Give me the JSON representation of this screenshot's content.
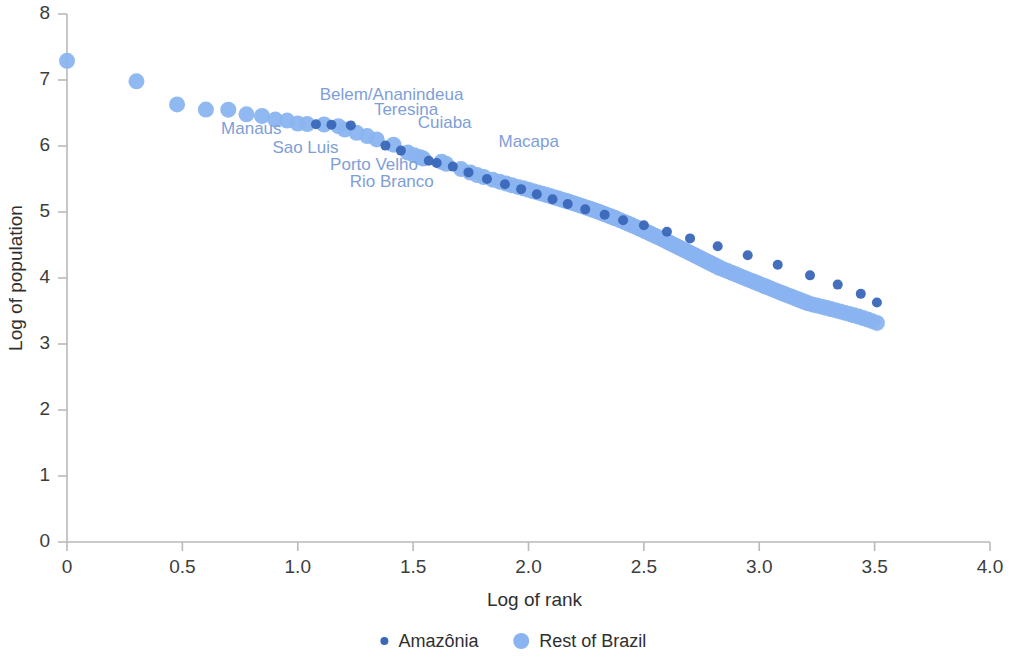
{
  "chart_data": {
    "type": "scatter",
    "title": "",
    "xlabel": "Log of rank",
    "ylabel": "Log of population",
    "xlim": [
      0,
      4.0
    ],
    "ylim": [
      0,
      8
    ],
    "xticks": [
      "0",
      "0.5",
      "1.0",
      "1.5",
      "2.0",
      "2.5",
      "3.0",
      "3.5",
      "4.0"
    ],
    "xtick_values": [
      0,
      0.5,
      1.0,
      1.5,
      2.0,
      2.5,
      3.0,
      3.5,
      4.0
    ],
    "yticks": [
      "0",
      "1",
      "2",
      "3",
      "4",
      "5",
      "6",
      "7",
      "8"
    ],
    "ytick_values": [
      0,
      1,
      2,
      3,
      4,
      5,
      6,
      7,
      8
    ],
    "grid": false,
    "legend_position": "bottom-center",
    "colors": {
      "amazonia": "#3a67b8",
      "rest_of_brazil": "#8ab4f0",
      "annotation": "#7e9ed8",
      "axis": "#b9b9b9",
      "text": "#3d3d3d"
    },
    "series": [
      {
        "name": "Amazônia",
        "color": "#3a67b8",
        "marker_size": 5,
        "points": [
          [
            1.079,
            6.33
          ],
          [
            1.146,
            6.323
          ],
          [
            1.23,
            6.312
          ],
          [
            1.38,
            6.006
          ],
          [
            1.447,
            5.93
          ],
          [
            1.568,
            5.777
          ],
          [
            1.602,
            5.742
          ],
          [
            1.672,
            5.688
          ],
          [
            1.74,
            5.6
          ],
          [
            1.82,
            5.5
          ],
          [
            1.898,
            5.42
          ],
          [
            1.968,
            5.346
          ],
          [
            2.036,
            5.268
          ],
          [
            2.104,
            5.194
          ],
          [
            2.17,
            5.12
          ],
          [
            2.246,
            5.04
          ],
          [
            2.33,
            4.958
          ],
          [
            2.41,
            4.876
          ],
          [
            2.5,
            4.8
          ],
          [
            2.6,
            4.7
          ],
          [
            2.7,
            4.6
          ],
          [
            2.82,
            4.48
          ],
          [
            2.95,
            4.345
          ],
          [
            3.08,
            4.2
          ],
          [
            3.22,
            4.04
          ],
          [
            3.34,
            3.9
          ],
          [
            3.44,
            3.76
          ],
          [
            3.51,
            3.63
          ]
        ]
      },
      {
        "name": "Rest of Brazil",
        "color": "#8ab4f0",
        "marker_size": 8,
        "points": [
          [
            0.0,
            7.29
          ],
          [
            0.301,
            6.98
          ],
          [
            0.477,
            6.63
          ],
          [
            0.602,
            6.552
          ],
          [
            0.699,
            6.55
          ],
          [
            0.778,
            6.48
          ],
          [
            0.845,
            6.455
          ],
          [
            0.903,
            6.4
          ],
          [
            0.954,
            6.385
          ],
          [
            1.0,
            6.34
          ],
          [
            1.041,
            6.332
          ],
          [
            1.114,
            6.326
          ],
          [
            1.176,
            6.3
          ],
          [
            1.204,
            6.25
          ],
          [
            1.255,
            6.2
          ],
          [
            1.301,
            6.15
          ],
          [
            1.342,
            6.1
          ],
          [
            1.415,
            6.02
          ],
          [
            1.477,
            5.9
          ],
          [
            1.505,
            5.86
          ],
          [
            1.531,
            5.83
          ],
          [
            1.544,
            5.81
          ],
          [
            1.623,
            5.76
          ],
          [
            1.643,
            5.73
          ],
          [
            1.708,
            5.65
          ],
          [
            1.748,
            5.598
          ],
          [
            1.778,
            5.56
          ],
          [
            1.806,
            5.53
          ],
          [
            1.845,
            5.49
          ],
          [
            1.875,
            5.46
          ],
          [
            1.903,
            5.43
          ],
          [
            1.929,
            5.404
          ],
          [
            1.954,
            5.38
          ],
          [
            1.978,
            5.358
          ],
          [
            2.0,
            5.336
          ],
          [
            2.021,
            5.314
          ],
          [
            2.041,
            5.294
          ],
          [
            2.061,
            5.275
          ],
          [
            2.079,
            5.256
          ],
          [
            2.097,
            5.238
          ],
          [
            2.114,
            5.22
          ],
          [
            2.13,
            5.203
          ],
          [
            2.146,
            5.186
          ],
          [
            2.161,
            5.17
          ],
          [
            2.176,
            5.154
          ],
          [
            2.19,
            5.138
          ],
          [
            2.204,
            5.122
          ],
          [
            2.217,
            5.107
          ],
          [
            2.23,
            5.092
          ],
          [
            2.243,
            5.077
          ],
          [
            2.255,
            5.062
          ],
          [
            2.267,
            5.048
          ],
          [
            2.279,
            5.034
          ],
          [
            2.29,
            5.02
          ],
          [
            2.301,
            5.006
          ],
          [
            2.312,
            4.992
          ],
          [
            2.322,
            4.978
          ],
          [
            2.332,
            4.965
          ],
          [
            2.342,
            4.952
          ],
          [
            2.352,
            4.939
          ],
          [
            2.362,
            4.926
          ],
          [
            2.371,
            4.913
          ],
          [
            2.38,
            4.9
          ],
          [
            2.398,
            4.875
          ],
          [
            2.415,
            4.85
          ],
          [
            2.431,
            4.826
          ],
          [
            2.447,
            4.802
          ],
          [
            2.462,
            4.778
          ],
          [
            2.477,
            4.755
          ],
          [
            2.491,
            4.732
          ],
          [
            2.505,
            4.71
          ],
          [
            2.519,
            4.688
          ],
          [
            2.532,
            4.666
          ],
          [
            2.545,
            4.645
          ],
          [
            2.558,
            4.624
          ],
          [
            2.571,
            4.603
          ],
          [
            2.583,
            4.582
          ],
          [
            2.595,
            4.562
          ],
          [
            2.607,
            4.542
          ],
          [
            2.618,
            4.522
          ],
          [
            2.629,
            4.503
          ],
          [
            2.64,
            4.484
          ],
          [
            2.651,
            4.465
          ],
          [
            2.662,
            4.446
          ],
          [
            2.672,
            4.428
          ],
          [
            2.683,
            4.41
          ],
          [
            2.693,
            4.392
          ],
          [
            2.703,
            4.374
          ],
          [
            2.713,
            4.357
          ],
          [
            2.723,
            4.34
          ],
          [
            2.732,
            4.323
          ],
          [
            2.742,
            4.306
          ],
          [
            2.751,
            4.29
          ],
          [
            2.76,
            4.274
          ],
          [
            2.77,
            4.258
          ],
          [
            2.778,
            4.242
          ],
          [
            2.787,
            4.226
          ],
          [
            2.796,
            4.211
          ],
          [
            2.805,
            4.196
          ],
          [
            2.813,
            4.181
          ],
          [
            2.822,
            4.166
          ],
          [
            2.83,
            4.152
          ],
          [
            2.845,
            4.13
          ],
          [
            2.863,
            4.105
          ],
          [
            2.881,
            4.08
          ],
          [
            2.898,
            4.056
          ],
          [
            2.914,
            4.032
          ],
          [
            2.93,
            4.009
          ],
          [
            2.946,
            3.986
          ],
          [
            2.962,
            3.964
          ],
          [
            2.978,
            3.942
          ],
          [
            2.993,
            3.92
          ],
          [
            3.008,
            3.899
          ],
          [
            3.023,
            3.878
          ],
          [
            3.037,
            3.858
          ],
          [
            3.051,
            3.838
          ],
          [
            3.064,
            3.819
          ],
          [
            3.078,
            3.8
          ],
          [
            3.091,
            3.782
          ],
          [
            3.104,
            3.764
          ],
          [
            3.117,
            3.746
          ],
          [
            3.13,
            3.728
          ],
          [
            3.143,
            3.711
          ],
          [
            3.155,
            3.694
          ],
          [
            3.167,
            3.678
          ],
          [
            3.179,
            3.662
          ],
          [
            3.19,
            3.646
          ],
          [
            3.201,
            3.631
          ],
          [
            3.212,
            3.616
          ],
          [
            3.23,
            3.6
          ],
          [
            3.25,
            3.582
          ],
          [
            3.27,
            3.565
          ],
          [
            3.29,
            3.548
          ],
          [
            3.31,
            3.53
          ],
          [
            3.33,
            3.512
          ],
          [
            3.35,
            3.494
          ],
          [
            3.37,
            3.475
          ],
          [
            3.39,
            3.456
          ],
          [
            3.41,
            3.436
          ],
          [
            3.43,
            3.415
          ],
          [
            3.45,
            3.393
          ],
          [
            3.47,
            3.37
          ],
          [
            3.49,
            3.346
          ],
          [
            3.51,
            3.32
          ]
        ]
      }
    ],
    "annotations": [
      {
        "text": "Belem/Ananindeua",
        "x": 1.087,
        "y": 6.33,
        "label_x": 1.095,
        "label_y": 6.7,
        "anchor": "start"
      },
      {
        "text": "Teresina",
        "x": 1.23,
        "y": 6.312,
        "label_x": 1.33,
        "label_y": 6.47,
        "anchor": "start"
      },
      {
        "text": "Cuiaba",
        "x": 1.447,
        "y": 5.93,
        "label_x": 1.52,
        "label_y": 6.27,
        "anchor": "start"
      },
      {
        "text": "Macapa",
        "x": 1.74,
        "y": 5.6,
        "label_x": 1.87,
        "label_y": 5.98,
        "anchor": "start"
      },
      {
        "text": "Manaus",
        "x": 1.0,
        "y": 6.34,
        "label_x": 0.668,
        "label_y": 6.175,
        "anchor": "start"
      },
      {
        "text": "Sao Luis",
        "x": 1.146,
        "y": 6.323,
        "label_x": 0.89,
        "label_y": 5.9,
        "anchor": "start"
      },
      {
        "text": "Porto Velho",
        "x": 1.38,
        "y": 6.006,
        "label_x": 1.14,
        "label_y": 5.63,
        "anchor": "start"
      },
      {
        "text": "Rio Branco",
        "x": 1.568,
        "y": 5.777,
        "label_x": 1.225,
        "label_y": 5.38,
        "anchor": "start"
      }
    ],
    "legend": [
      {
        "label": "Amazônia",
        "color": "#3a67b8",
        "radius": 4
      },
      {
        "label": "Rest of Brazil",
        "color": "#8ab4f0",
        "radius": 8
      }
    ]
  }
}
